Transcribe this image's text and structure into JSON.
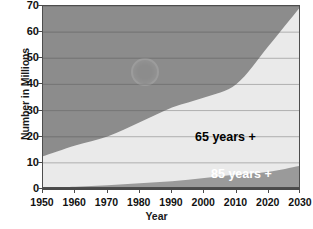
{
  "chart_data": {
    "type": "area",
    "title": "",
    "subtitle": "",
    "xlabel": "Year",
    "ylabel": "Number in Millions",
    "xlim": [
      1950,
      2030
    ],
    "ylim": [
      0,
      70
    ],
    "grid": true,
    "stacked": false,
    "legend_position": "inside-right",
    "xticks": [
      1950,
      1960,
      1970,
      1980,
      1990,
      2000,
      2010,
      2020,
      2030
    ],
    "yticks": [
      0,
      10,
      20,
      30,
      40,
      50,
      60,
      70
    ],
    "x": [
      1950,
      1960,
      1970,
      1980,
      1990,
      2000,
      2010,
      2020,
      2030
    ],
    "series": [
      {
        "name": "65 years +",
        "label": "65 years +",
        "label_color": "#000000",
        "fill_color": "#eaeaea",
        "values": [
          12.5,
          16.6,
          20.1,
          25.5,
          31.2,
          35.0,
          40.2,
          54.8,
          70.0
        ]
      },
      {
        "name": "85 years +",
        "label": "85 years +",
        "label_color": "#ffffff",
        "fill_color": "#9a9a9a",
        "values": [
          0.6,
          0.9,
          1.4,
          2.2,
          3.0,
          4.2,
          5.5,
          6.6,
          9.0
        ]
      }
    ],
    "annotations": [
      {
        "name": "watermark",
        "text": ""
      }
    ]
  },
  "colors": {
    "plot_background": "#8c8c8c",
    "band_65_plus": "#eaeaea",
    "band_85_plus": "#9a9a9a",
    "gridline": "#6f6f6f",
    "axis": "#4a4a4a",
    "page_background": "#ffffff",
    "text": "#111111"
  },
  "axes": {
    "y_title": "Number in Millions",
    "x_title": "Year",
    "y_labels": [
      "70",
      "60",
      "50",
      "40",
      "30",
      "20",
      "10",
      "0"
    ],
    "x_labels": [
      "1950",
      "1960",
      "1970",
      "1980",
      "1990",
      "2000",
      "2010",
      "2020",
      "2030"
    ]
  }
}
